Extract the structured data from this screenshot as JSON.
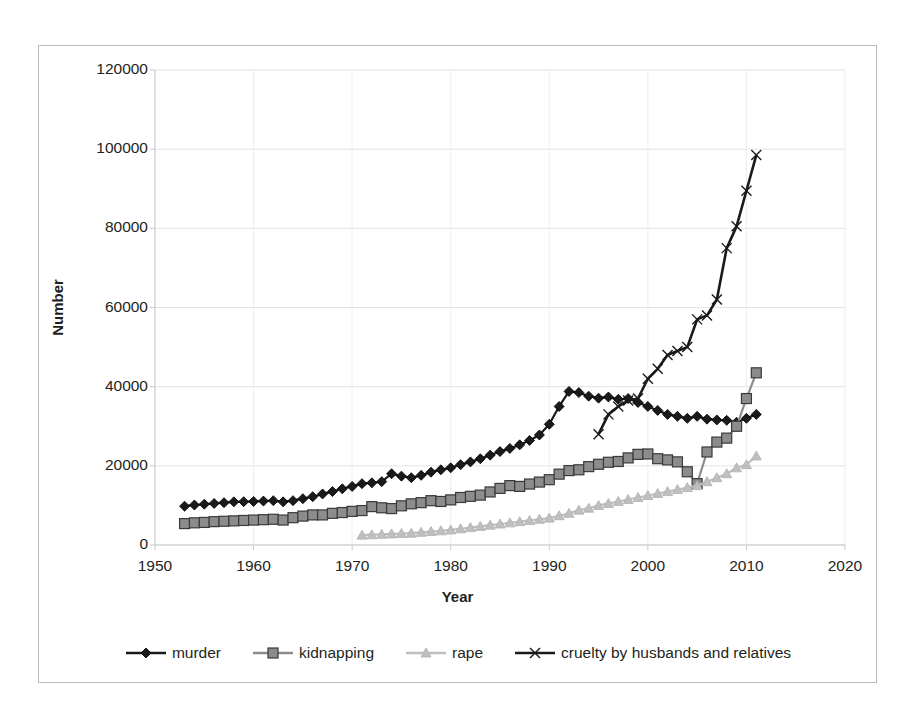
{
  "chart_data": {
    "type": "line",
    "title": "",
    "xlabel": "Year",
    "ylabel": "Number",
    "xlim": [
      1950,
      2020
    ],
    "ylim": [
      0,
      120000
    ],
    "xticks": [
      1950,
      1960,
      1970,
      1980,
      1990,
      2000,
      2010,
      2020
    ],
    "yticks": [
      0,
      20000,
      40000,
      60000,
      80000,
      100000,
      120000
    ],
    "grid": true,
    "legend_position": "bottom",
    "series": [
      {
        "name": "murder",
        "marker": "diamond",
        "color": "#1a1a1a",
        "x": [
          1953,
          1954,
          1955,
          1956,
          1957,
          1958,
          1959,
          1960,
          1961,
          1962,
          1963,
          1964,
          1965,
          1966,
          1967,
          1968,
          1969,
          1970,
          1971,
          1972,
          1973,
          1974,
          1975,
          1976,
          1977,
          1978,
          1979,
          1980,
          1981,
          1982,
          1983,
          1984,
          1985,
          1986,
          1987,
          1988,
          1989,
          1990,
          1991,
          1992,
          1993,
          1994,
          1995,
          1996,
          1997,
          1998,
          1999,
          2000,
          2001,
          2002,
          2003,
          2004,
          2005,
          2006,
          2007,
          2008,
          2009,
          2010,
          2011
        ],
        "values": [
          9802,
          10100,
          10300,
          10500,
          10700,
          10900,
          10950,
          11000,
          11100,
          11200,
          10900,
          11200,
          11700,
          12200,
          12900,
          13500,
          14200,
          14800,
          15500,
          15700,
          16000,
          18000,
          17400,
          17000,
          17600,
          18400,
          19000,
          19500,
          20300,
          21000,
          21800,
          22700,
          23600,
          24400,
          25300,
          26400,
          27800,
          30500,
          35000,
          38800,
          38500,
          37600,
          37100,
          37400,
          36800,
          37000,
          36000,
          35000,
          34000,
          33000,
          32500,
          32000,
          32500,
          31800,
          31600,
          31500,
          31000,
          32000,
          33000
        ]
      },
      {
        "name": "kidnapping",
        "marker": "square",
        "color": "#8c8c8c",
        "x": [
          1953,
          1954,
          1955,
          1956,
          1957,
          1958,
          1959,
          1960,
          1961,
          1962,
          1963,
          1964,
          1965,
          1966,
          1967,
          1968,
          1969,
          1970,
          1971,
          1972,
          1973,
          1974,
          1975,
          1976,
          1977,
          1978,
          1979,
          1980,
          1981,
          1982,
          1983,
          1984,
          1985,
          1986,
          1987,
          1988,
          1989,
          1990,
          1991,
          1992,
          1993,
          1994,
          1995,
          1996,
          1997,
          1998,
          1999,
          2000,
          2001,
          2002,
          2003,
          2004,
          2005,
          2006,
          2007,
          2008,
          2009,
          2010,
          2011
        ],
        "values": [
          5410,
          5600,
          5700,
          5900,
          6000,
          6100,
          6200,
          6300,
          6400,
          6500,
          6300,
          6900,
          7300,
          7600,
          7600,
          8000,
          8200,
          8500,
          8700,
          9700,
          9400,
          9200,
          9900,
          10400,
          10700,
          11200,
          11000,
          11400,
          12000,
          12300,
          12600,
          13400,
          14300,
          15000,
          14800,
          15400,
          15900,
          16500,
          17900,
          18800,
          19000,
          19800,
          20400,
          20900,
          21100,
          22000,
          22900,
          23000,
          21800,
          21500,
          21000,
          18500,
          15500,
          23500,
          26000,
          27000,
          30000,
          37000,
          43500
        ]
      },
      {
        "name": "rape",
        "marker": "triangle",
        "color": "#bfbfbf",
        "x": [
          1971,
          1972,
          1973,
          1974,
          1975,
          1976,
          1977,
          1978,
          1979,
          1980,
          1981,
          1982,
          1983,
          1984,
          1985,
          1986,
          1987,
          1988,
          1989,
          1990,
          1991,
          1992,
          1993,
          1994,
          1995,
          1996,
          1997,
          1998,
          1999,
          2000,
          2001,
          2002,
          2003,
          2004,
          2005,
          2006,
          2007,
          2008,
          2009,
          2010,
          2011
        ],
        "values": [
          2487,
          2600,
          2700,
          2800,
          2900,
          3000,
          3200,
          3400,
          3600,
          3800,
          4100,
          4400,
          4700,
          5000,
          5300,
          5600,
          5900,
          6200,
          6500,
          6800,
          7400,
          8000,
          8800,
          9300,
          10000,
          10500,
          11000,
          11500,
          12000,
          12500,
          13000,
          13500,
          14000,
          14500,
          15000,
          16000,
          17000,
          18000,
          19500,
          20300,
          22500
        ]
      },
      {
        "name": "cruelty by husbands and relatives",
        "marker": "x",
        "color": "#1a1a1a",
        "x": [
          1995,
          1996,
          1997,
          1998,
          1999,
          2000,
          2001,
          2002,
          2003,
          2004,
          2005,
          2006,
          2007,
          2008,
          2009,
          2010,
          2011
        ],
        "values": [
          28000,
          33000,
          35000,
          36500,
          37000,
          42000,
          44500,
          48000,
          49000,
          50000,
          57000,
          58000,
          62000,
          75000,
          80500,
          89500,
          98500
        ]
      }
    ]
  },
  "axes": {
    "ytick_labels": [
      "120000",
      "100000",
      "80000",
      "60000",
      "40000",
      "20000",
      "0"
    ],
    "xtick_labels": [
      "1950",
      "1960",
      "1970",
      "1980",
      "1990",
      "2000",
      "2010",
      "2020"
    ],
    "ylabel": "Number",
    "xlabel": "Year"
  },
  "legend": {
    "items": [
      {
        "label": "murder",
        "marker": "diamond",
        "color": "#1a1a1a"
      },
      {
        "label": "kidnapping",
        "marker": "square",
        "color": "#8c8c8c"
      },
      {
        "label": "rape",
        "marker": "triangle",
        "color": "#bfbfbf"
      },
      {
        "label": "cruelty by husbands and relatives",
        "marker": "x",
        "color": "#1a1a1a"
      }
    ]
  },
  "colors": {
    "grid": "#e3e3e3",
    "axis": "#c9c9c9",
    "border": "#b9bbbd",
    "text": "#231f20",
    "background": "#ffffff"
  }
}
